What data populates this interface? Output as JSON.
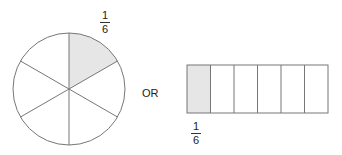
{
  "diagram": {
    "connector_label": "OR",
    "circle": {
      "parts": 6,
      "shaded_parts": 1,
      "label": {
        "numerator": "1",
        "denominator": "6"
      }
    },
    "rectangle": {
      "parts": 6,
      "shaded_parts": 1,
      "label": {
        "numerator": "1",
        "denominator": "6"
      }
    },
    "colors": {
      "shade": "#e6e6e6",
      "stroke": "#777777"
    }
  }
}
